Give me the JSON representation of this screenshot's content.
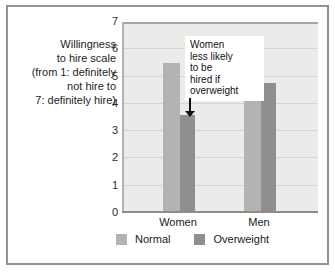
{
  "colors": {
    "figure_border": "#929292",
    "plot_bg": "#ebebe9",
    "gridline": "#d7d5d3",
    "axis_line": "#8c8c8c",
    "normal_bar": "#b4b2b2",
    "overweight_bar": "#908e8e",
    "annotation_bg": "#ffffff",
    "text": "#1d1d1d"
  },
  "y_axis": {
    "title_lines": [
      "Willingness",
      "to hire scale",
      "(from 1: definitely",
      "not hire to",
      "7: definitely hire)"
    ]
  },
  "annotation": {
    "lines": [
      "Women",
      "less likely",
      "to be",
      "hired if",
      "overweight"
    ]
  },
  "chart_data": {
    "type": "bar",
    "categories": [
      "Women",
      "Men"
    ],
    "series": [
      {
        "name": "Normal",
        "values": [
          5.5,
          5.9
        ],
        "color": "#b4b2b2"
      },
      {
        "name": "Overweight",
        "values": [
          3.6,
          4.75
        ],
        "color": "#908e8e"
      }
    ],
    "ylabel": "Willingness to hire scale (from 1: definitely not hire to 7: definitely hire)",
    "xlabel": "",
    "ylim": [
      0,
      7
    ],
    "yticks": [
      0,
      1,
      2,
      3,
      4,
      5,
      6,
      7
    ],
    "grid": true,
    "legend": [
      "Normal",
      "Overweight"
    ],
    "legend_position": "bottom",
    "annotation": "Women less likely to be hired if overweight",
    "annotation_target": "Women Overweight bar"
  }
}
